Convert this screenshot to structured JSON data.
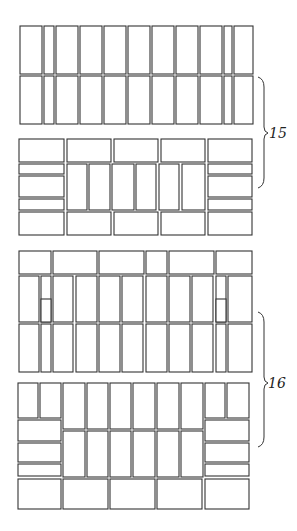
{
  "figure": {
    "annotations": [
      {
        "label": "15",
        "refers_to": "upper panel bracketed section"
      },
      {
        "label": "16",
        "refers_to": "lower panel bracketed section"
      }
    ]
  }
}
